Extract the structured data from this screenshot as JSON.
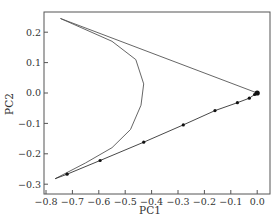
{
  "chart_data": {
    "type": "line",
    "title": "",
    "xlabel": "PC1",
    "ylabel": "PC2",
    "xlim": [
      -0.8,
      0.03
    ],
    "ylim": [
      -0.3,
      0.265
    ],
    "grid": false,
    "legend": null,
    "x_ticks": [
      -0.8,
      -0.7,
      -0.6,
      -0.5,
      -0.4,
      -0.3,
      -0.2,
      -0.1,
      0.0
    ],
    "x_tick_labels": [
      "−0.8",
      "−0.7",
      "−0.6",
      "−0.5",
      "−0.4",
      "−0.3",
      "−0.2",
      "−0.1",
      "0.0"
    ],
    "y_ticks": [
      0.2,
      0.1,
      0.0,
      -0.1,
      -0.2,
      -0.3
    ],
    "y_tick_labels": [
      "0.2",
      "0.1",
      "0.0",
      "−0.1",
      "−0.2",
      "−0.3"
    ],
    "series": [
      {
        "name": "trajectory-curve",
        "style": "line",
        "color": "#555555",
        "x": [
          -0.745,
          -0.55,
          -0.46,
          -0.43,
          -0.44,
          -0.48,
          -0.55,
          -0.65,
          -0.765
        ],
        "y": [
          0.245,
          0.17,
          0.11,
          0.03,
          -0.04,
          -0.12,
          -0.18,
          -0.23,
          -0.282
        ]
      },
      {
        "name": "upper-line",
        "style": "line",
        "color": "#555555",
        "x": [
          -0.745,
          0.0
        ],
        "y": [
          0.245,
          0.0
        ]
      },
      {
        "name": "lower-line-with-markers",
        "style": "line+markers",
        "color": "#333333",
        "x": [
          -0.765,
          -0.72,
          -0.595,
          -0.43,
          -0.28,
          -0.16,
          -0.075,
          -0.03,
          -0.01,
          0.0
        ],
        "y": [
          -0.282,
          -0.267,
          -0.222,
          -0.162,
          -0.105,
          -0.058,
          -0.032,
          -0.017,
          -0.005,
          0.0
        ],
        "markers_x": [
          -0.72,
          -0.595,
          -0.43,
          -0.28,
          -0.16,
          -0.075,
          -0.03,
          -0.01,
          0.0
        ],
        "markers_y": [
          -0.267,
          -0.222,
          -0.162,
          -0.105,
          -0.058,
          -0.032,
          -0.017,
          -0.005,
          0.0
        ]
      }
    ]
  }
}
